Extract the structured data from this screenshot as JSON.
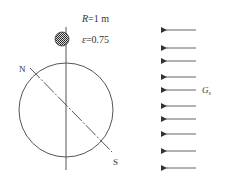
{
  "diagram": {
    "labels": {
      "radius": "R=1 m",
      "emissivity": "ε=0.75",
      "north": "N",
      "south": "S",
      "irradiation": "G",
      "irradiation_sub": "s"
    },
    "arrows_y": [
      30,
      48,
      61,
      77,
      90,
      106,
      119,
      134,
      151,
      168
    ],
    "colors": {
      "line": "#555555",
      "arrow": "#666666"
    }
  }
}
